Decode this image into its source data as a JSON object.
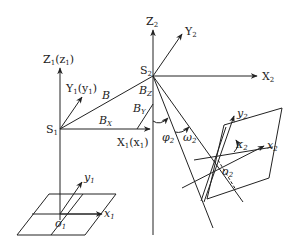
{
  "diagram": {
    "title": "",
    "labels": {
      "Z1": {
        "main": "Z",
        "sub": "1",
        "extra": "(z",
        "extra_sub": "1",
        "close": ")"
      },
      "Y1": {
        "main": "Y",
        "sub": "1",
        "extra": "(y",
        "extra_sub": "1",
        "close": ")"
      },
      "X1": {
        "main": "X",
        "sub": "1",
        "extra": "(x",
        "extra_sub": "1",
        "close": ")"
      },
      "S1": {
        "main": "S",
        "sub": "1"
      },
      "S2": {
        "main": "S",
        "sub": "2"
      },
      "Z2": {
        "main": "Z",
        "sub": "2"
      },
      "Y2": {
        "main": "Y",
        "sub": "2"
      },
      "X2": {
        "main": "X",
        "sub": "2"
      },
      "B": {
        "main": "B"
      },
      "BX": {
        "main": "B",
        "sub": "X"
      },
      "BY": {
        "main": "B",
        "sub": "Y"
      },
      "BZ": {
        "main": "B",
        "sub": "Z"
      },
      "phi2": {
        "main": "φ",
        "sub": "2"
      },
      "omega2": {
        "main": "ω",
        "sub": "2"
      },
      "kappa2": {
        "main": "κ",
        "sub": "2"
      },
      "x1": {
        "main": "x",
        "sub": "1"
      },
      "y1": {
        "main": "y",
        "sub": "1"
      },
      "o1": {
        "main": "o",
        "sub": "1"
      },
      "x2": {
        "main": "x",
        "sub": "2"
      },
      "y2": {
        "main": "y",
        "sub": "2"
      },
      "o2": {
        "main": "o",
        "sub": "2"
      }
    },
    "points": {
      "S1": [
        60,
        129
      ],
      "S2": [
        153,
        76
      ],
      "o1": [
        60,
        216
      ],
      "o2": [
        218,
        164
      ]
    },
    "colors": {
      "stroke": "#222222",
      "background": "#ffffff"
    }
  }
}
